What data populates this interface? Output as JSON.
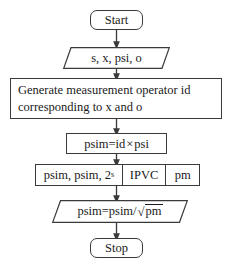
{
  "diagram": {
    "background_color": "#ffffff",
    "line_color": "#3a3a3a",
    "text_color": "#1a1a1a",
    "nodes": [
      {
        "id": "start",
        "shape": "terminal",
        "label": "Start"
      },
      {
        "id": "inputs",
        "shape": "parallelogram",
        "label": "s, x, psi, o"
      },
      {
        "id": "generate",
        "shape": "process",
        "line1": "Generate measurement operator id",
        "line2": "corresponding to x and o"
      },
      {
        "id": "psim_calc",
        "shape": "process",
        "label_a": "psim=id",
        "operator": "×",
        "label_b": "psi"
      },
      {
        "id": "ipvc_row",
        "shape": "split-process",
        "cell1_pre": "psim, psim, 2",
        "cell1_exp": "s",
        "cell2": "IPVC",
        "cell3": "pm"
      },
      {
        "id": "normalize",
        "shape": "parallelogram",
        "pre": "psim=psim/",
        "radical": "√",
        "radicand": "pm"
      },
      {
        "id": "stop",
        "shape": "terminal",
        "label": "Stop"
      }
    ],
    "edges": [
      {
        "from": "start",
        "to": "inputs"
      },
      {
        "from": "inputs",
        "to": "generate"
      },
      {
        "from": "generate",
        "to": "psim_calc"
      },
      {
        "from": "psim_calc",
        "to": "ipvc_row"
      },
      {
        "from": "ipvc_row",
        "to": "normalize"
      },
      {
        "from": "normalize",
        "to": "stop"
      }
    ]
  }
}
